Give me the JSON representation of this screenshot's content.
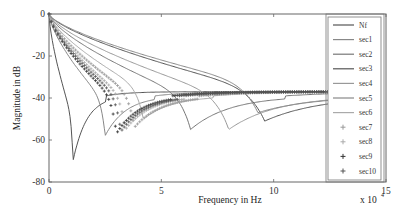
{
  "chart_data": {
    "type": "line",
    "title": "",
    "xlabel": "Frequency in Hz",
    "ylabel": "Magnitude in dB",
    "x_multiplier_label": "x 10",
    "x_multiplier_exp": "4",
    "xlim": [
      0,
      150000
    ],
    "ylim": [
      -80,
      0
    ],
    "xticks": [
      0,
      5,
      10,
      15
    ],
    "yticks": [
      0,
      -20,
      -40,
      -60,
      -80
    ],
    "grid": false,
    "legend_position": "right-inside",
    "series": [
      {
        "name": "Nf",
        "style": "line",
        "color": "#555555",
        "notch_freq": 10700,
        "notch_db": -70,
        "plateau_db": -37
      },
      {
        "name": "sec1",
        "style": "line",
        "color": "#888888",
        "notch_freq": 25000,
        "notch_db": -58,
        "plateau_db": -37
      },
      {
        "name": "sec2",
        "style": "line",
        "color": "#777777",
        "notch_freq": 63000,
        "notch_db": -55,
        "plateau_db": -37
      },
      {
        "name": "sec3",
        "style": "line",
        "color": "#555555",
        "notch_freq": 96000,
        "notch_db": -51,
        "plateau_db": -37
      },
      {
        "name": "sec4",
        "style": "line",
        "color": "#999999",
        "notch_freq": 80000,
        "notch_db": -55,
        "plateau_db": -37
      },
      {
        "name": "sec5",
        "style": "line",
        "color": "#888888",
        "notch_freq": 93000,
        "notch_db": -47,
        "plateau_db": -37
      },
      {
        "name": "sec6",
        "style": "line",
        "color": "#aaaaaa",
        "notch_freq": 42000,
        "notch_db": -50,
        "plateau_db": -37
      },
      {
        "name": "sec7",
        "style": "plus",
        "color": "#999999",
        "notch_freq": 38000,
        "notch_db": -54,
        "plateau_db": -37
      },
      {
        "name": "sec8",
        "style": "plus",
        "color": "#aaaaaa",
        "notch_freq": 34000,
        "notch_db": -55,
        "plateau_db": -37
      },
      {
        "name": "sec9",
        "style": "plus",
        "color": "#333333",
        "notch_freq": 30000,
        "notch_db": -57,
        "plateau_db": -37
      },
      {
        "name": "sec10",
        "style": "plus",
        "color": "#555555",
        "notch_freq": 32000,
        "notch_db": -56,
        "plateau_db": -37
      }
    ]
  }
}
